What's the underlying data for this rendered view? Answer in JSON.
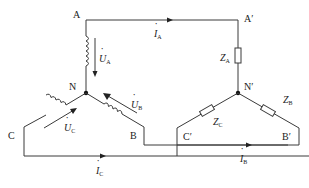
{
  "diagram": {
    "type": "three-phase star-star circuit",
    "source_nodes": {
      "A": "A",
      "B": "B",
      "C": "C",
      "N": "N"
    },
    "load_nodes": {
      "A": "A′",
      "B": "B′",
      "C": "C′",
      "N": "N′"
    },
    "voltages": {
      "UA": {
        "main": "U",
        "sub": "A"
      },
      "UB": {
        "main": "U",
        "sub": "B"
      },
      "UC": {
        "main": "U",
        "sub": "C"
      }
    },
    "currents": {
      "IA": {
        "main": "I",
        "sub": "A"
      },
      "IB": {
        "main": "I",
        "sub": "B"
      },
      "IC": {
        "main": "I",
        "sub": "C"
      }
    },
    "impedances": {
      "ZA": {
        "main": "Z",
        "sub": "A"
      },
      "ZB": {
        "main": "Z",
        "sub": "B"
      },
      "ZC": {
        "main": "Z",
        "sub": "C"
      }
    },
    "dot": "·"
  }
}
